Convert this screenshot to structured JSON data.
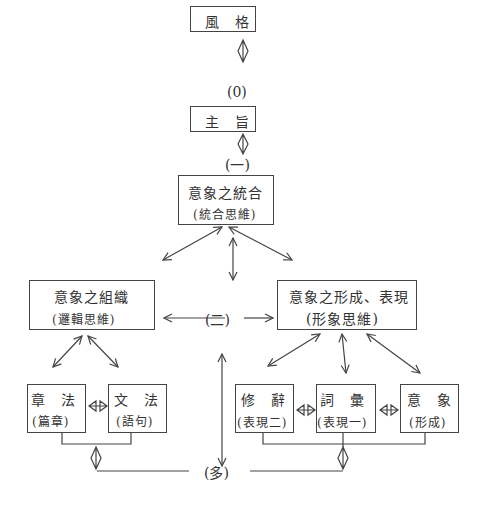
{
  "nodes": {
    "style": {
      "title": "風　格"
    },
    "level0": {
      "label": "(0)"
    },
    "theme": {
      "title": "主　旨"
    },
    "level1": {
      "label": "(一)"
    },
    "integration": {
      "title": "意象之統合",
      "subtitle": "(統合思維)"
    },
    "level2": {
      "label": "(二)"
    },
    "organization": {
      "title": "意象之組織",
      "subtitle": "(邏輯思維)"
    },
    "formation": {
      "title": "意象之形成、表現",
      "subtitle": "(形象思維)"
    },
    "zhangfa": {
      "title": "章　法",
      "subtitle": "(篇章)"
    },
    "wenfa": {
      "title": "文　法",
      "subtitle": "(語句)"
    },
    "xiuci": {
      "title": "修　辭",
      "subtitle": "(表現二)"
    },
    "cihui": {
      "title": "詞　彙",
      "subtitle": "(表現一)"
    },
    "yixiang": {
      "title": "意　象",
      "subtitle": "(形成)"
    },
    "levelMany": {
      "label": "(多)"
    }
  }
}
